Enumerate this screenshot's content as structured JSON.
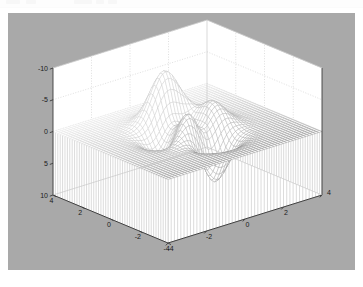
{
  "window": {
    "app": "figure-window",
    "background_color": "#a9a9a9",
    "page_background": "#ffffff"
  },
  "chrome": {
    "visible_sliver": true,
    "color": "#fdfdfd"
  },
  "chart_data": {
    "type": "surface",
    "render_style": "meshz",
    "title": "",
    "xlabel": "",
    "ylabel": "",
    "zlabel": "",
    "function": "peaks",
    "grid": true,
    "legend": false,
    "mesh_color": "#7a7a7a",
    "skirt_color": "#9a9a9a",
    "wall_color": "#ffffff",
    "gridline_color": "#c9c9c9",
    "axis_line_color": "#3c3c3c",
    "xlim": [
      -4,
      4
    ],
    "ylim": [
      -4,
      4
    ],
    "zlim": [
      -10,
      10
    ],
    "x_ticks": [
      -4,
      -2,
      0,
      2,
      4
    ],
    "y_ticks": [
      -4,
      -2,
      0,
      2,
      4
    ],
    "z_ticks": [
      -10,
      -5,
      0,
      5,
      10
    ],
    "x_tick_labels": [
      "-4",
      "-2",
      "0",
      "2",
      "4"
    ],
    "y_tick_labels": [
      "4",
      "2",
      "0",
      "-2",
      "-4"
    ],
    "z_tick_labels": [
      "10",
      "5",
      "0",
      "-5",
      "-10"
    ],
    "grid_n": 49,
    "view_azimuth": -37.5,
    "view_elevation": 30,
    "skirt_base": -10,
    "z_peak_max": 8.1,
    "z_peak_min": -6.5
  },
  "labels": {
    "z": [
      "10",
      "5",
      "0",
      "-5",
      "-10"
    ],
    "y_left": [
      "4",
      "2",
      "0",
      "-2",
      "-4"
    ],
    "x_right": [
      "-4",
      "-2",
      "0",
      "2",
      "4"
    ]
  }
}
